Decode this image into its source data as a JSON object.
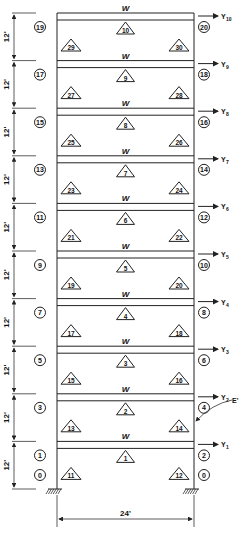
{
  "diagram": {
    "type": "ten-story single-bay plane frame",
    "bay_width_label": "24'",
    "story_height_label": "12'",
    "beam_load_label": "W",
    "secant_label": "E'",
    "stories": [
      {
        "level": 1,
        "beam_element": "1",
        "left_column": "11",
        "right_column": "12",
        "left_node": "1",
        "right_node": "2",
        "disp": "Y",
        "disp_sub": "1"
      },
      {
        "level": 2,
        "beam_element": "2",
        "left_column": "13",
        "right_column": "14",
        "left_node": "3",
        "right_node": "4",
        "disp": "Y",
        "disp_sub": "2"
      },
      {
        "level": 3,
        "beam_element": "3",
        "left_column": "15",
        "right_column": "16",
        "left_node": "5",
        "right_node": "6",
        "disp": "Y",
        "disp_sub": "3"
      },
      {
        "level": 4,
        "beam_element": "4",
        "left_column": "17",
        "right_column": "18",
        "left_node": "7",
        "right_node": "8",
        "disp": "Y",
        "disp_sub": "4"
      },
      {
        "level": 5,
        "beam_element": "5",
        "left_column": "19",
        "right_column": "20",
        "left_node": "9",
        "right_node": "10",
        "disp": "Y",
        "disp_sub": "5"
      },
      {
        "level": 6,
        "beam_element": "6",
        "left_column": "21",
        "right_column": "22",
        "left_node": "11",
        "right_node": "12",
        "disp": "Y",
        "disp_sub": "6"
      },
      {
        "level": 7,
        "beam_element": "7",
        "left_column": "23",
        "right_column": "24",
        "left_node": "13",
        "right_node": "14",
        "disp": "Y",
        "disp_sub": "7"
      },
      {
        "level": 8,
        "beam_element": "8",
        "left_column": "25",
        "right_column": "26",
        "left_node": "15",
        "right_node": "16",
        "disp": "Y",
        "disp_sub": "8"
      },
      {
        "level": 9,
        "beam_element": "9",
        "left_column": "27",
        "right_column": "28",
        "left_node": "17",
        "right_node": "18",
        "disp": "Y",
        "disp_sub": "9"
      },
      {
        "level": 10,
        "beam_element": "10",
        "left_column": "29",
        "right_column": "30",
        "left_node": "19",
        "right_node": "20",
        "disp": "Y",
        "disp_sub": "10"
      }
    ],
    "base_nodes": {
      "left": "0",
      "right": "0"
    },
    "colors": {
      "line": "#222222",
      "background": "#ffffff"
    }
  }
}
